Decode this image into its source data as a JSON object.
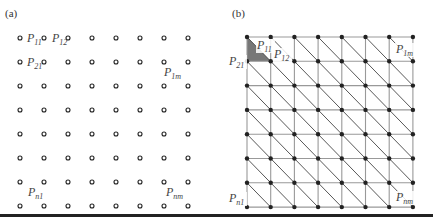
{
  "panels": {
    "a": {
      "label": "(a)",
      "rows": 8,
      "cols": 8,
      "origin": [
        20,
        38
      ],
      "spacing": [
        24,
        24
      ],
      "point_style": "open-circle",
      "labels": [
        {
          "base": "P",
          "sub": "11",
          "x": 27,
          "y": 42
        },
        {
          "base": "P",
          "sub": "12",
          "x": 52,
          "y": 42
        },
        {
          "base": "P",
          "sub": "21",
          "x": 27,
          "y": 66
        },
        {
          "base": "P",
          "sub": "1m",
          "x": 164,
          "y": 76
        },
        {
          "base": "P",
          "sub": "n1",
          "x": 28,
          "y": 196
        },
        {
          "base": "P",
          "sub": "nm",
          "x": 166,
          "y": 196
        }
      ]
    },
    "b": {
      "label": "(b)",
      "rows": 8,
      "cols": 8,
      "origin": [
        247,
        37
      ],
      "spacing": [
        23.7,
        24.3
      ],
      "point_style": "filled-dot",
      "shaded_triangle_color": "#777777",
      "labels": [
        {
          "base": "P",
          "sub": "11",
          "x": 257,
          "y": 49
        },
        {
          "base": "P",
          "sub": "12",
          "x": 274,
          "y": 58
        },
        {
          "base": "P",
          "sub": "21",
          "x": 229,
          "y": 65
        },
        {
          "base": "P",
          "sub": "1m",
          "x": 396,
          "y": 53
        },
        {
          "base": "P",
          "sub": "n1",
          "x": 229,
          "y": 202
        },
        {
          "base": "P",
          "sub": "nm",
          "x": 396,
          "y": 201
        }
      ]
    }
  },
  "colors": {
    "grid_line": "#999999",
    "diag_line": "#444444",
    "node": "#222222",
    "rule": "#222222"
  }
}
